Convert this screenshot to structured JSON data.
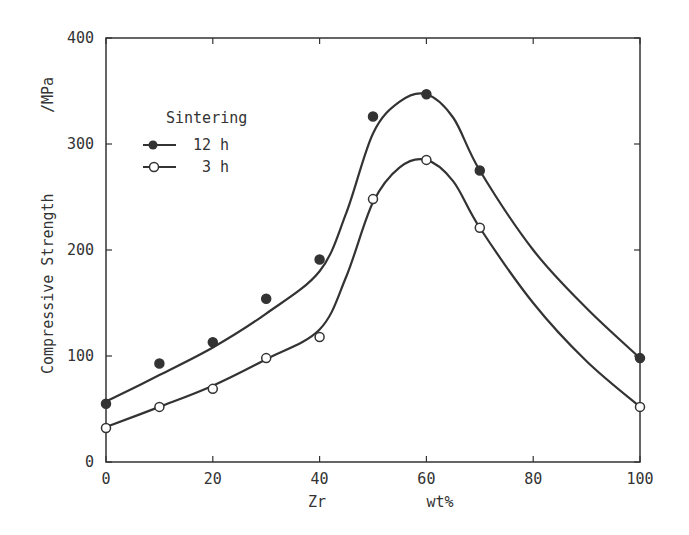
{
  "chart_data": {
    "type": "line",
    "title": "",
    "xlabel": "Zr",
    "xlabel_unit": "wt%",
    "ylabel": "Compressive Strength",
    "ylabel_unit": "/MPa",
    "xlim": [
      0,
      100
    ],
    "ylim": [
      0,
      400
    ],
    "xticks": [
      0,
      20,
      40,
      60,
      80,
      100
    ],
    "yticks": [
      0,
      100,
      200,
      300,
      400
    ],
    "grid": false,
    "legend": {
      "title": "Sintering",
      "position": "upper left",
      "entries": [
        "12 h",
        "3 h"
      ]
    },
    "series": [
      {
        "name": "12 h",
        "marker": "filled-circle",
        "x": [
          0,
          10,
          20,
          30,
          40,
          50,
          60,
          70,
          100
        ],
        "y": [
          55,
          93,
          113,
          154,
          191,
          326,
          347,
          275,
          98
        ],
        "curve_x": [
          0,
          10,
          20,
          30,
          40,
          45,
          50,
          55,
          60,
          65,
          70,
          80,
          90,
          100
        ],
        "curve_y": [
          57,
          82,
          108,
          140,
          180,
          235,
          310,
          340,
          347,
          325,
          275,
          200,
          145,
          98
        ]
      },
      {
        "name": "3 h",
        "marker": "open-circle",
        "x": [
          0,
          10,
          20,
          30,
          40,
          50,
          60,
          70,
          100
        ],
        "y": [
          32,
          52,
          69,
          98,
          118,
          248,
          285,
          221,
          52
        ],
        "curve_x": [
          0,
          10,
          20,
          30,
          40,
          45,
          50,
          55,
          60,
          65,
          70,
          80,
          90,
          100
        ],
        "curve_y": [
          33,
          52,
          72,
          97,
          125,
          175,
          245,
          278,
          285,
          265,
          221,
          150,
          95,
          52
        ]
      }
    ]
  },
  "colors": {
    "ink": "#333333",
    "background": "#ffffff"
  }
}
